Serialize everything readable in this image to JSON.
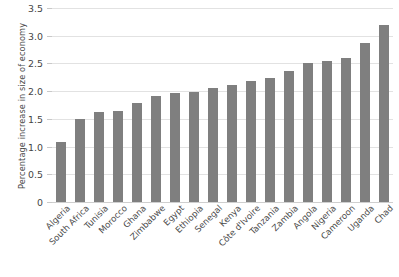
{
  "chart_data": {
    "type": "bar",
    "title": "",
    "xlabel": "",
    "ylabel": "Percentage increase in size of economy",
    "ylim": [
      0,
      3.5
    ],
    "yticks": [
      "0",
      "0.5",
      "1.0",
      "1.5",
      "2.0",
      "2.5",
      "3.0",
      "3.5"
    ],
    "ytick_values": [
      0,
      0.5,
      1.0,
      1.5,
      2.0,
      2.5,
      3.0,
      3.5
    ],
    "grid": true,
    "legend": "none",
    "bar_color": "#7f7f7f",
    "categories": [
      "Algeria",
      "South Africa",
      "Tunisia",
      "Morocco",
      "Ghana",
      "Zimbabwe",
      "Egypt",
      "Ethiopia",
      "Senegal",
      "Kenya",
      "Côte d'Ivoire",
      "Tanzania",
      "Zambia",
      "Angola",
      "Nigeria",
      "Cameroon",
      "Uganda",
      "Chad"
    ],
    "values": [
      1.08,
      1.5,
      1.62,
      1.64,
      1.78,
      1.91,
      1.97,
      1.98,
      2.05,
      2.12,
      2.18,
      2.23,
      2.36,
      2.5,
      2.55,
      2.6,
      2.87,
      3.19
    ]
  }
}
